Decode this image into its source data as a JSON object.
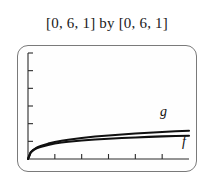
{
  "figure": {
    "title": "[0, 6, 1] by [0, 6, 1]",
    "frame_style": "graphing-calculator-screen",
    "frame_color": "#7a7a7a",
    "screen_background": "#fefefe",
    "curve_color": "#101010"
  },
  "chart_data": {
    "type": "line",
    "title": "[0, 6, 1] by [0, 6, 1]",
    "xlabel": "",
    "ylabel": "",
    "xlim": [
      0,
      6
    ],
    "ylim": [
      0,
      6
    ],
    "xtick_step": 1,
    "ytick_step": 1,
    "xticks": [
      1,
      2,
      3,
      4,
      5
    ],
    "yticks": [
      1,
      2,
      3,
      4,
      5
    ],
    "xticklabels": [
      "",
      "",
      "",
      "",
      ""
    ],
    "yticklabels": [
      "",
      "",
      "",
      "",
      ""
    ],
    "grid": false,
    "legend": "inline-labels",
    "annotations": [
      {
        "text": "g",
        "x": 4.9,
        "y": 1.85,
        "style": "italic"
      },
      {
        "text": "f",
        "x": 5.6,
        "y": 0.9,
        "style": "italic"
      }
    ],
    "series": [
      {
        "name": "g",
        "label": "g",
        "color": "#101010",
        "x": [
          0.0,
          0.1,
          0.2,
          0.3,
          0.4,
          0.5,
          0.75,
          1.0,
          1.25,
          1.5,
          2.0,
          2.5,
          3.0,
          3.5,
          4.0,
          4.5,
          5.0,
          5.5,
          6.0
        ],
        "y": [
          0.0,
          0.38,
          0.52,
          0.62,
          0.69,
          0.75,
          0.87,
          0.96,
          1.03,
          1.09,
          1.19,
          1.27,
          1.33,
          1.39,
          1.44,
          1.49,
          1.53,
          1.57,
          1.6
        ]
      },
      {
        "name": "f",
        "label": "f",
        "color": "#101010",
        "x": [
          0.0,
          0.1,
          0.2,
          0.3,
          0.4,
          0.5,
          0.75,
          1.0,
          1.25,
          1.5,
          2.0,
          2.5,
          3.0,
          3.5,
          4.0,
          4.5,
          5.0,
          5.5,
          6.0
        ],
        "y": [
          0.0,
          0.37,
          0.5,
          0.59,
          0.65,
          0.7,
          0.8,
          0.88,
          0.93,
          0.98,
          1.05,
          1.1,
          1.15,
          1.19,
          1.22,
          1.25,
          1.28,
          1.3,
          1.32
        ]
      }
    ]
  },
  "labels": {
    "g": "g",
    "f": "f"
  }
}
